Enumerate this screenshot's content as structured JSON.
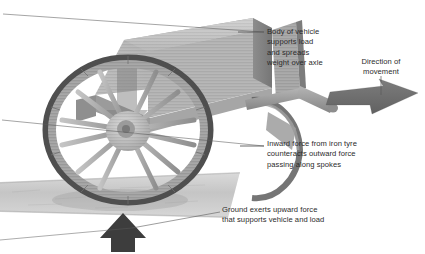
{
  "diagram": {
    "background_color": "#ffffff",
    "text_color": "#2b2b2b",
    "leader_line_color": "#5a5a5a",
    "arrow_color": "#6e6e6e",
    "ground_arrow_color": "#3d3d3d"
  },
  "labels": {
    "body_of_vehicle": {
      "name": "body-of-vehicle-label",
      "text": "Body of vehicle\nsupports load\nand spreads\nweight over axle",
      "align": "left"
    },
    "direction_of_movement": {
      "name": "direction-of-movement-label",
      "text": "Direction of\nmovement",
      "align": "center"
    },
    "inward_force": {
      "name": "inward-force-label",
      "text": "Inward force from iron tyre\ncounteracts outward force\npassing along spokes",
      "align": "left"
    },
    "ground_force": {
      "name": "ground-force-label",
      "text": "Ground exerts upward force\nthat supports vehicle and load",
      "align": "left"
    }
  },
  "arrows": [
    {
      "name": "direction-of-movement-arrow",
      "direction": "right",
      "style": "3d-flat-perspective",
      "color": "#6e6e6e"
    },
    {
      "name": "ground-upward-force-arrow",
      "direction": "up",
      "style": "solid-filled",
      "color": "#3d3d3d"
    },
    {
      "name": "downward-load-arrow",
      "direction": "down",
      "style": "overlay-on-wheel",
      "color": "#8a8a8a"
    }
  ],
  "parts": [
    {
      "name": "cart-body",
      "label": "Body of vehicle"
    },
    {
      "name": "cart-wheel",
      "label": "Spoked wheel",
      "spoke_count": 14
    },
    {
      "name": "iron-tyre",
      "label": "Iron tyre rim"
    },
    {
      "name": "wheel-hub",
      "label": "Hub"
    },
    {
      "name": "axle-shaft",
      "label": "Axle"
    },
    {
      "name": "ground-plane",
      "label": "Ground"
    }
  ]
}
